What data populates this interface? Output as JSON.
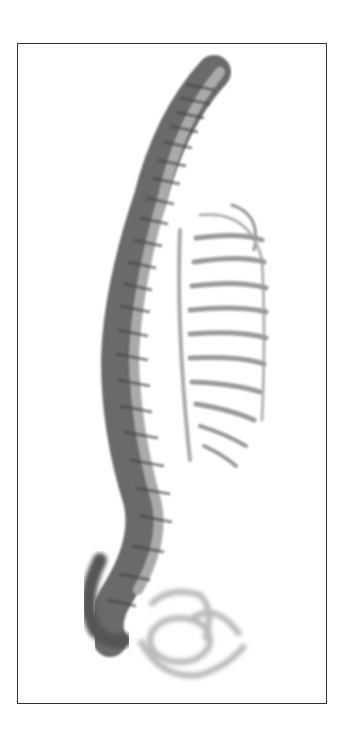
{
  "figure": {
    "style": "grayscale engraving-like illustration",
    "colors": {
      "border": "#333333",
      "bone_dark": "#555555",
      "bone_mid": "#8a8a8a",
      "bone_light": "#c8c8c8",
      "background": "#ffffff"
    }
  }
}
